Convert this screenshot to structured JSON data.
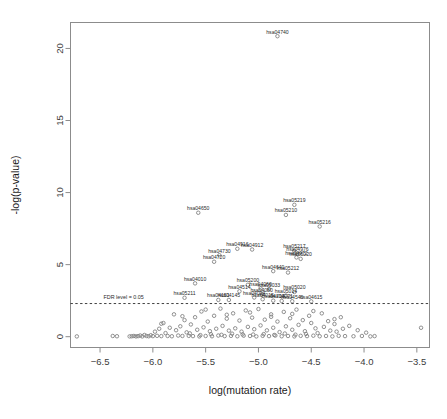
{
  "chart_data": {
    "type": "scatter",
    "title": "",
    "xlabel": "log(mutation rate)",
    "ylabel": "-log(p-value)",
    "xlim": [
      -6.78,
      -3.38
    ],
    "ylim": [
      -0.75,
      21.8
    ],
    "xticks": [
      -6.5,
      -6.0,
      -5.5,
      -5.0,
      -4.5,
      -4.0,
      -3.5
    ],
    "xticklabels": [
      "-6.5",
      "-6.0",
      "-5.5",
      "-5.0",
      "-4.5",
      "-4.0",
      "-3.5"
    ],
    "yticks": [
      0,
      5,
      10,
      15,
      20
    ],
    "yticklabels": [
      "0",
      "5",
      "10",
      "15",
      "20"
    ],
    "grid": false,
    "legend": null,
    "marker": "open-circle",
    "marker_color": "#7d7d7d",
    "threshold_line": {
      "label": "FDR level = 0.05",
      "y": 2.3,
      "style": "dashed",
      "color": "#2b2b2b"
    },
    "labeled_points": [
      {
        "label": "hsa04740",
        "x": -4.82,
        "y": 20.85
      },
      {
        "label": "hsa05219",
        "x": -4.66,
        "y": 9.15
      },
      {
        "label": "hsa04650",
        "x": -5.57,
        "y": 8.6
      },
      {
        "label": "hsa05210",
        "x": -4.74,
        "y": 8.45
      },
      {
        "label": "hsa05216",
        "x": -4.42,
        "y": 7.65
      },
      {
        "label": "hsa04916",
        "x": -5.2,
        "y": 6.1
      },
      {
        "label": "hsa04912",
        "x": -5.06,
        "y": 6.05
      },
      {
        "label": "hsa05217",
        "x": -4.66,
        "y": 5.95
      },
      {
        "label": "hsa04976",
        "x": -4.63,
        "y": 5.75
      },
      {
        "label": "hsa04730",
        "x": -5.37,
        "y": 5.65
      },
      {
        "label": "hsa04972",
        "x": -4.64,
        "y": 5.5
      },
      {
        "label": "hsa05220",
        "x": -4.6,
        "y": 5.4
      },
      {
        "label": "hsa04720",
        "x": -5.42,
        "y": 5.2
      },
      {
        "label": "hsa04640",
        "x": -4.86,
        "y": 4.55
      },
      {
        "label": "hsa05212",
        "x": -4.72,
        "y": 4.45
      },
      {
        "label": "hsa04010",
        "x": -5.6,
        "y": 3.7
      },
      {
        "label": "hsa05200",
        "x": -5.1,
        "y": 3.6
      },
      {
        "label": "hsa04060",
        "x": -4.98,
        "y": 3.35
      },
      {
        "label": "hsa05033",
        "x": -4.9,
        "y": 3.3
      },
      {
        "label": "hsa04514",
        "x": -5.18,
        "y": 3.15
      },
      {
        "label": "hsa05020",
        "x": -4.66,
        "y": 3.1
      },
      {
        "label": "hsa04080",
        "x": -4.97,
        "y": 2.95
      },
      {
        "label": "hsa05014",
        "x": -4.74,
        "y": 2.85
      },
      {
        "label": "hsa05211",
        "x": -5.7,
        "y": 2.7
      },
      {
        "label": "hsa04024",
        "x": -5.04,
        "y": 2.72
      },
      {
        "label": "hsa04015",
        "x": -4.96,
        "y": 2.6
      },
      {
        "label": "hsa04145",
        "x": -5.28,
        "y": 2.55
      },
      {
        "label": "hsa04151",
        "x": -5.38,
        "y": 2.55
      },
      {
        "label": "hsa04713",
        "x": -4.86,
        "y": 2.5
      },
      {
        "label": "hsa04071",
        "x": -4.78,
        "y": 2.48
      },
      {
        "label": "hsa04540",
        "x": -4.68,
        "y": 2.46
      },
      {
        "label": "hsa04615",
        "x": -4.5,
        "y": 2.45
      }
    ],
    "background_points": [
      {
        "x": -6.72,
        "y": 0.02
      },
      {
        "x": -6.38,
        "y": 0.05
      },
      {
        "x": -6.34,
        "y": 0.03
      },
      {
        "x": -6.22,
        "y": 0.02
      },
      {
        "x": -6.14,
        "y": 0.04
      },
      {
        "x": -6.12,
        "y": 0.08
      },
      {
        "x": -6.1,
        "y": 0.02
      },
      {
        "x": -6.08,
        "y": 0.12
      },
      {
        "x": -6.06,
        "y": 0.05
      },
      {
        "x": -6.04,
        "y": 0.03
      },
      {
        "x": -6.02,
        "y": 0.1
      },
      {
        "x": -6.0,
        "y": 0.04
      },
      {
        "x": -5.98,
        "y": 0.35
      },
      {
        "x": -5.96,
        "y": 0.06
      },
      {
        "x": -5.94,
        "y": 0.55
      },
      {
        "x": -5.92,
        "y": 0.04
      },
      {
        "x": -5.9,
        "y": 0.95
      },
      {
        "x": -5.88,
        "y": 0.25
      },
      {
        "x": -5.86,
        "y": 0.05
      },
      {
        "x": -5.84,
        "y": 0.62
      },
      {
        "x": -5.82,
        "y": 0.03
      },
      {
        "x": -5.8,
        "y": 1.55
      },
      {
        "x": -5.78,
        "y": 0.45
      },
      {
        "x": -5.76,
        "y": 0.08
      },
      {
        "x": -5.74,
        "y": 0.72
      },
      {
        "x": -5.72,
        "y": 0.05
      },
      {
        "x": -5.7,
        "y": 1.15
      },
      {
        "x": -5.68,
        "y": 0.3
      },
      {
        "x": -5.66,
        "y": 0.06
      },
      {
        "x": -5.64,
        "y": 0.85
      },
      {
        "x": -5.62,
        "y": 0.04
      },
      {
        "x": -5.6,
        "y": 1.35
      },
      {
        "x": -5.58,
        "y": 0.48
      },
      {
        "x": -5.56,
        "y": 0.02
      },
      {
        "x": -5.54,
        "y": 1.75
      },
      {
        "x": -5.52,
        "y": 0.65
      },
      {
        "x": -5.5,
        "y": 0.05
      },
      {
        "x": -5.48,
        "y": 1.05
      },
      {
        "x": -5.46,
        "y": 0.38
      },
      {
        "x": -5.44,
        "y": 0.03
      },
      {
        "x": -5.42,
        "y": 1.45
      },
      {
        "x": -5.4,
        "y": 0.55
      },
      {
        "x": -5.38,
        "y": 0.08
      },
      {
        "x": -5.36,
        "y": 1.95
      },
      {
        "x": -5.34,
        "y": 0.75
      },
      {
        "x": -5.32,
        "y": 0.04
      },
      {
        "x": -5.3,
        "y": 1.25
      },
      {
        "x": -5.28,
        "y": 0.42
      },
      {
        "x": -5.26,
        "y": 0.06
      },
      {
        "x": -5.24,
        "y": 1.62
      },
      {
        "x": -5.22,
        "y": 0.58
      },
      {
        "x": -5.2,
        "y": 0.03
      },
      {
        "x": -5.18,
        "y": 1.12
      },
      {
        "x": -5.16,
        "y": 0.35
      },
      {
        "x": -5.14,
        "y": 0.07
      },
      {
        "x": -5.12,
        "y": 1.82
      },
      {
        "x": -5.1,
        "y": 0.68
      },
      {
        "x": -5.08,
        "y": 0.05
      },
      {
        "x": -5.06,
        "y": 1.32
      },
      {
        "x": -5.04,
        "y": 0.52
      },
      {
        "x": -5.02,
        "y": 0.02
      },
      {
        "x": -5.0,
        "y": 1.92
      },
      {
        "x": -4.98,
        "y": 0.78
      },
      {
        "x": -4.96,
        "y": 0.06
      },
      {
        "x": -4.94,
        "y": 1.18
      },
      {
        "x": -4.92,
        "y": 0.44
      },
      {
        "x": -4.9,
        "y": 0.04
      },
      {
        "x": -4.88,
        "y": 1.55
      },
      {
        "x": -4.86,
        "y": 0.62
      },
      {
        "x": -4.84,
        "y": 0.08
      },
      {
        "x": -4.82,
        "y": 1.05
      },
      {
        "x": -4.8,
        "y": 0.32
      },
      {
        "x": -4.78,
        "y": 0.03
      },
      {
        "x": -4.76,
        "y": 1.72
      },
      {
        "x": -4.74,
        "y": 0.72
      },
      {
        "x": -4.72,
        "y": 0.05
      },
      {
        "x": -4.7,
        "y": 1.28
      },
      {
        "x": -4.68,
        "y": 0.48
      },
      {
        "x": -4.66,
        "y": 0.02
      },
      {
        "x": -4.64,
        "y": 1.88
      },
      {
        "x": -4.62,
        "y": 0.82
      },
      {
        "x": -4.6,
        "y": 0.06
      },
      {
        "x": -4.58,
        "y": 1.15
      },
      {
        "x": -4.56,
        "y": 0.38
      },
      {
        "x": -4.54,
        "y": 0.04
      },
      {
        "x": -4.52,
        "y": 1.45
      },
      {
        "x": -4.5,
        "y": 0.95
      },
      {
        "x": -4.48,
        "y": 0.07
      },
      {
        "x": -4.46,
        "y": 0.58
      },
      {
        "x": -4.44,
        "y": 0.25
      },
      {
        "x": -4.42,
        "y": 0.03
      },
      {
        "x": -4.4,
        "y": 1.62
      },
      {
        "x": -4.38,
        "y": 0.68
      },
      {
        "x": -4.36,
        "y": 0.05
      },
      {
        "x": -4.34,
        "y": 1.08
      },
      {
        "x": -4.32,
        "y": 0.42
      },
      {
        "x": -4.3,
        "y": 0.02
      },
      {
        "x": -4.28,
        "y": 0.88
      },
      {
        "x": -4.26,
        "y": 0.35
      },
      {
        "x": -4.24,
        "y": 0.06
      },
      {
        "x": -4.22,
        "y": 1.35
      },
      {
        "x": -4.2,
        "y": 0.55
      },
      {
        "x": -4.18,
        "y": 0.04
      },
      {
        "x": -4.14,
        "y": 0.75
      },
      {
        "x": -4.1,
        "y": 0.03
      },
      {
        "x": -4.06,
        "y": 0.45
      },
      {
        "x": -4.02,
        "y": 0.05
      },
      {
        "x": -3.98,
        "y": 0.28
      },
      {
        "x": -3.94,
        "y": 0.02
      },
      {
        "x": -3.9,
        "y": 0.04
      },
      {
        "x": -3.46,
        "y": 0.62
      },
      {
        "x": -5.92,
        "y": 0.9
      },
      {
        "x": -5.72,
        "y": 1.42
      },
      {
        "x": -5.5,
        "y": 1.88
      },
      {
        "x": -5.3,
        "y": 1.52
      },
      {
        "x": -5.08,
        "y": 1.68
      },
      {
        "x": -4.88,
        "y": 1.38
      },
      {
        "x": -4.68,
        "y": 1.58
      },
      {
        "x": -4.48,
        "y": 1.78
      },
      {
        "x": -4.28,
        "y": 1.22
      },
      {
        "x": -6.16,
        "y": 0.02
      },
      {
        "x": -6.18,
        "y": 0.05
      },
      {
        "x": -6.2,
        "y": 0.03
      },
      {
        "x": -5.05,
        "y": 0.15
      },
      {
        "x": -4.95,
        "y": 0.18
      },
      {
        "x": -4.85,
        "y": 0.12
      },
      {
        "x": -4.75,
        "y": 0.22
      },
      {
        "x": -4.65,
        "y": 0.14
      },
      {
        "x": -4.55,
        "y": 0.19
      },
      {
        "x": -5.15,
        "y": 0.16
      },
      {
        "x": -5.25,
        "y": 0.21
      },
      {
        "x": -5.35,
        "y": 0.13
      },
      {
        "x": -5.45,
        "y": 0.17
      },
      {
        "x": -5.55,
        "y": 0.11
      },
      {
        "x": -5.65,
        "y": 0.23
      }
    ]
  }
}
